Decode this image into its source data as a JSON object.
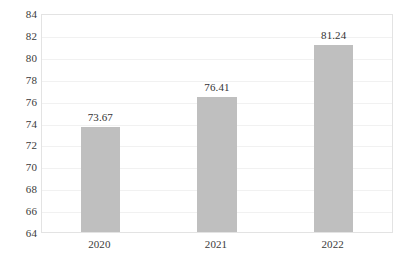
{
  "chart_data": {
    "type": "bar",
    "title": "",
    "subtitle": "",
    "xlabel": "",
    "ylabel": "",
    "categories": [
      "2020",
      "2021",
      "2022"
    ],
    "values": [
      73.67,
      76.41,
      81.24
    ],
    "data_labels": [
      "73.67",
      "76.41",
      "81.24"
    ],
    "ylim": [
      64,
      84
    ],
    "ytick_step": 2,
    "ytick_labels": [
      "84",
      "82",
      "80",
      "78",
      "76",
      "74",
      "72",
      "70",
      "68",
      "66",
      "64"
    ],
    "grid": true,
    "grid_axis": "y",
    "legend": false,
    "legend_position": "none",
    "series": [
      {
        "name": "",
        "values": [
          73.67,
          76.41,
          81.24
        ],
        "color": "#bfbfbf"
      }
    ]
  },
  "style": {
    "bar_color": "#bfbfbf",
    "grid_color": "#f1f1f1",
    "plot_border_color": "#e3e3e3",
    "text_color": "#3a3a3a",
    "label_color": "#333333",
    "background": "#ffffff"
  }
}
